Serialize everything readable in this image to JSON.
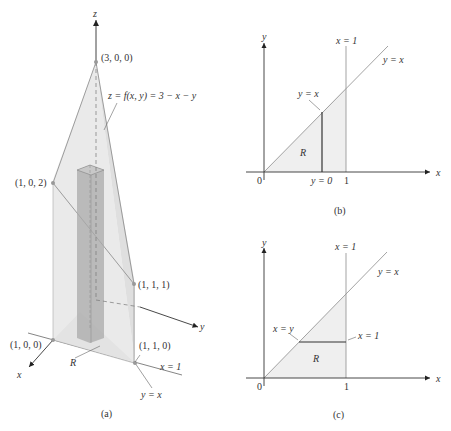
{
  "figure": {
    "panel_a": {
      "caption": "(a)",
      "axis_z": "z",
      "axis_y": "y",
      "axis_x": "x",
      "point_300": "(3, 0, 0)",
      "point_102": "(1, 0, 2)",
      "point_111": "(1, 1, 1)",
      "point_100": "(1, 0, 0)",
      "point_110": "(1, 1, 0)",
      "surface_label": "z = f(x, y) = 3 − x − y",
      "region_label": "R",
      "line_x1": "x = 1",
      "line_yx": "y = x"
    },
    "panel_b": {
      "caption": "(b)",
      "axis_y": "y",
      "axis_x": "x",
      "origin": "0",
      "tick_1": "1",
      "line_x1": "x = 1",
      "line_yx": "y = x",
      "segment_top": "y = x",
      "segment_bottom": "y = 0",
      "region_label": "R"
    },
    "panel_c": {
      "caption": "(c)",
      "axis_y": "y",
      "axis_x": "x",
      "origin": "0",
      "tick_1": "1",
      "line_x1": "x = 1",
      "line_yx": "y = x",
      "segment_left": "x = y",
      "segment_right": "x = 1",
      "region_label": "R"
    },
    "colors": {
      "line": "#555555",
      "fill_light": "#e4e4e4",
      "fill_region": "#f0f0f0",
      "prism": "#a8a8a8"
    }
  }
}
